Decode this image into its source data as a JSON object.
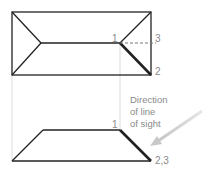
{
  "diagram": {
    "top_view": {
      "labels": {
        "point1": "1",
        "point2": "2",
        "point3": "3"
      }
    },
    "front_view": {
      "labels": {
        "point1": "1",
        "point23": "2,3"
      }
    },
    "annotation": {
      "line1": "Direction",
      "line2": "of line",
      "line3": "of sight"
    },
    "colors": {
      "outline": "#222222",
      "label": "#8a8a8a",
      "projection": "#d8d8d8",
      "arrow": "#cccccc"
    }
  }
}
